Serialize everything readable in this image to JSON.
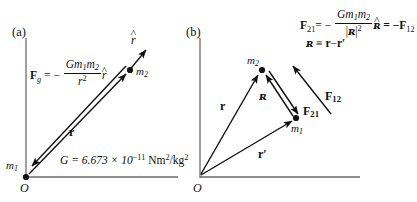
{
  "figure": {
    "background_color": "#ffffff",
    "ink_color": "#111111",
    "axis_color": "#5a5a5a"
  },
  "panel_a": {
    "tag": "(a)",
    "origin_label": "O",
    "mass1_label": "m",
    "mass1_sub": "1",
    "mass2_label": "m",
    "mass2_sub": "2",
    "r_vector_label": "r",
    "rhat_label": "r",
    "rhat_mark": "^",
    "force_lhs": "F",
    "force_lhs_sub": "g",
    "force_eq": "= −",
    "numerator": "Gm",
    "numerator_sub1": "1",
    "numerator_m2": "m",
    "numerator_sub2": "2",
    "denominator": "r",
    "denominator_sup": "2",
    "force_unit_vector": "r",
    "force_unit_hat": "^",
    "constant_text": "G = 6.673 × 10",
    "constant_exponent": "−11",
    "constant_units": " Nm",
    "constant_units_sup": "2",
    "constant_units_tail": "/kg",
    "constant_units_tail_sup": "2"
  },
  "panel_b": {
    "tag": "(b)",
    "origin_label": "O",
    "mass1_label": "m",
    "mass1_sub": "1",
    "mass2_label": "m",
    "mass2_sub": "2",
    "r_vector_label": "r",
    "rprime_vector_label": "r",
    "rprime_mark": "′",
    "script_r_label": "ʀ",
    "force21_label": "F",
    "force21_sub": "21",
    "force12_label": "F",
    "force12_sub": "12",
    "equation_lhs": "F",
    "equation_lhs_sub": "21",
    "equation_eq": "= −",
    "equation_num": "Gm",
    "equation_num_sub1": "1",
    "equation_num_m2": "m",
    "equation_num_sub2": "2",
    "equation_den_open": "|",
    "equation_den_script": "ʀ",
    "equation_den_close": "|",
    "equation_den_sup": "2",
    "equation_unit_script": "ʀ",
    "equation_unit_hat": "^",
    "equation_tail": "= −F",
    "equation_tail_sub": "12",
    "definition_script": "ʀ",
    "definition_equiv": "≡",
    "definition_r": "r",
    "definition_minus": "−",
    "definition_rprime": "r",
    "definition_prime": "′"
  }
}
